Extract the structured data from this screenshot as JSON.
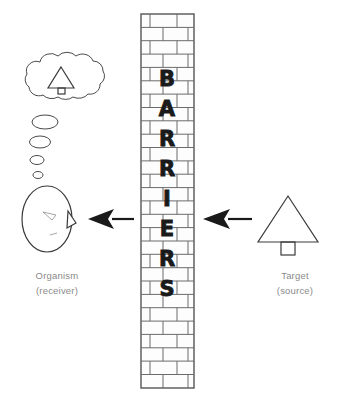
{
  "diagram": {
    "background_color": "#ffffff",
    "wall": {
      "name": "barrier-wall",
      "letters": [
        "B",
        "A",
        "R",
        "R",
        "I",
        "E",
        "R",
        "S"
      ],
      "word": "BARRIERS",
      "brick_color": "#fdfdfd",
      "mortar_color": "#6b6b6b",
      "outline_color": "#555555",
      "x": 141,
      "y": 14,
      "width": 53,
      "height": 374,
      "brick_rows": 28,
      "letter_color": "#1a1a1a"
    },
    "left_side": {
      "label_line1": "Organism",
      "label_line2": "(receiver)",
      "label_color": "#8a8a8a",
      "organism": {
        "name": "organism-body",
        "shape": "ellipse",
        "cx": 47,
        "cy": 219,
        "rx": 25,
        "ry": 33
      },
      "thought_bubble": {
        "name": "thought-bubble",
        "contains": "tree-icon",
        "trail_bubbles": 4
      }
    },
    "right_side": {
      "label_line1": "Target",
      "label_line2": "(source)",
      "label_color": "#8a8a8a",
      "target": {
        "name": "target-tree",
        "shape": "triangle-with-trunk",
        "cx": 288,
        "apex_y": 196,
        "base_y": 242,
        "half_width": 30
      }
    },
    "arrows": [
      {
        "name": "arrow-wall-to-organism",
        "direction": "left",
        "tip_x": 88,
        "tail_x": 134,
        "y": 219,
        "color": "#1a1a1a"
      },
      {
        "name": "arrow-target-to-wall",
        "direction": "left",
        "tip_x": 203,
        "tail_x": 252,
        "y": 219,
        "color": "#1a1a1a"
      }
    ]
  }
}
